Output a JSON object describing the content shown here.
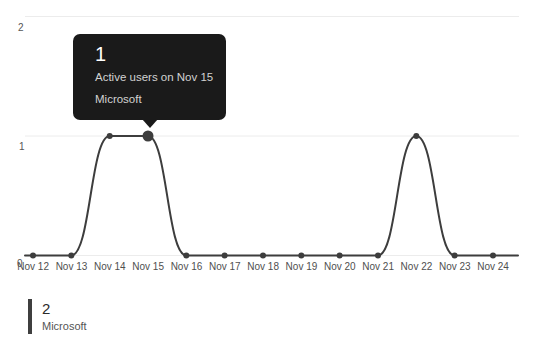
{
  "chart_data": {
    "type": "line",
    "x": [
      "Nov 12",
      "Nov 13",
      "Nov 14",
      "Nov 15",
      "Nov 16",
      "Nov 17",
      "Nov 18",
      "Nov 19",
      "Nov 20",
      "Nov 21",
      "Nov 22",
      "Nov 23",
      "Nov 24"
    ],
    "series": [
      {
        "name": "Microsoft",
        "values": [
          0,
          0,
          1,
          1,
          0,
          0,
          0,
          0,
          0,
          0,
          1,
          0,
          0
        ]
      }
    ],
    "y_ticks": [
      0,
      1,
      2
    ],
    "ylim": [
      0,
      2
    ],
    "grid": "horizontal-light",
    "legend_position": "bottom-left",
    "highlight": {
      "x_label": "Nov 15",
      "value": 1,
      "series": "Microsoft"
    }
  },
  "tooltip": {
    "value": "1",
    "description": "Active users on Nov 15",
    "series_label": "Microsoft"
  },
  "legend": {
    "value": "2",
    "label": "Microsoft"
  },
  "colors": {
    "line": "#3d3d3d",
    "point": "#3d3d3d",
    "grid": "#ececec",
    "tooltip_bg": "#1a1a1a",
    "tooltip_text": "#ffffff",
    "tooltip_subtext": "#d2d2d2",
    "axis_text": "#555555",
    "legend_bar": "#3f3f3f"
  }
}
